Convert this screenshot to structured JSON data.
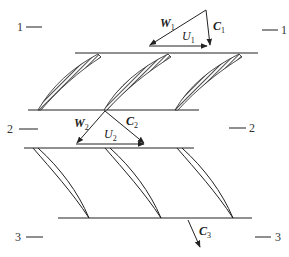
{
  "diagram": {
    "stations": {
      "left": [
        {
          "label": "1",
          "x": 17,
          "y": 31
        },
        {
          "label": "2",
          "x": 7,
          "y": 133
        },
        {
          "label": "3",
          "x": 15,
          "y": 241
        }
      ],
      "right": [
        {
          "label": "1",
          "x": 281,
          "y": 34
        },
        {
          "label": "2",
          "x": 249,
          "y": 132
        },
        {
          "label": "3",
          "x": 275,
          "y": 241
        }
      ]
    },
    "triangle_inlet": {
      "W": {
        "letter": "W",
        "sub": "1"
      },
      "C": {
        "letter": "C",
        "sub": "1"
      },
      "U": {
        "letter": "U",
        "sub": "1"
      }
    },
    "triangle_mid": {
      "W": {
        "letter": "W",
        "sub": "2"
      },
      "C": {
        "letter": "C",
        "sub": "2"
      },
      "U": {
        "letter": "U",
        "sub": "2"
      }
    },
    "exit_vector": {
      "letter": "C",
      "sub": "3"
    },
    "rows": {
      "rotor": {
        "blade_count": 3,
        "style": "hatched"
      },
      "stator": {
        "blade_count": 3,
        "style": "thin-airfoil"
      }
    },
    "colors": {
      "ink": "#222222",
      "background": "#ffffff"
    }
  }
}
